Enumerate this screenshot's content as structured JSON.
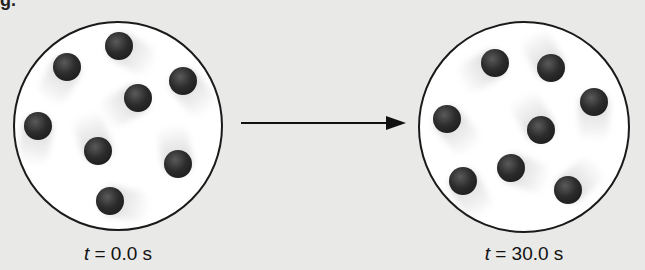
{
  "top_fragment": "g.",
  "containers": [
    {
      "name": "initial",
      "cx": 118,
      "cy": 126,
      "r": 105,
      "time_label": {
        "var": "t",
        "text": " = 0.0 s"
      },
      "molecules": [
        {
          "x": 119,
          "y": 46,
          "trail_angle": -60
        },
        {
          "x": 67,
          "y": 67,
          "trail_angle": 30
        },
        {
          "x": 183,
          "y": 81,
          "trail_angle": -40
        },
        {
          "x": 138,
          "y": 98,
          "trail_angle": 60
        },
        {
          "x": 38,
          "y": 126,
          "trail_angle": 10
        },
        {
          "x": 98,
          "y": 151,
          "trail_angle": 160
        },
        {
          "x": 178,
          "y": 164,
          "trail_angle": 170
        },
        {
          "x": 110,
          "y": 201,
          "trail_angle": -80
        }
      ]
    },
    {
      "name": "final",
      "cx": 524,
      "cy": 127,
      "r": 106,
      "time_label": {
        "var": "t",
        "text": " = 30.0 s"
      },
      "molecules": [
        {
          "x": 495,
          "y": 63,
          "trail_angle": 60
        },
        {
          "x": 551,
          "y": 68,
          "trail_angle": 150
        },
        {
          "x": 594,
          "y": 102,
          "trail_angle": 0
        },
        {
          "x": 447,
          "y": 119,
          "trail_angle": -40
        },
        {
          "x": 541,
          "y": 130,
          "trail_angle": 150
        },
        {
          "x": 511,
          "y": 168,
          "trail_angle": -70
        },
        {
          "x": 463,
          "y": 181,
          "trail_angle": -30
        },
        {
          "x": 568,
          "y": 190,
          "trail_angle": -130
        }
      ]
    }
  ],
  "arrow": {
    "from_x": 241,
    "to_x": 405,
    "y": 123,
    "label": "time progression"
  },
  "colors": {
    "background": "#e9e9e7",
    "container_fill": "#ffffff",
    "molecule": "#222222",
    "outline": "#1a1a1a"
  }
}
